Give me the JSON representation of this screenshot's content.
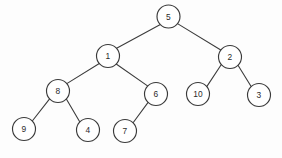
{
  "figure": {
    "type": "binary-tree-diagram",
    "background_color": "#fdfdfd",
    "node_fill_color": "#ffffff",
    "node_stroke_color": "#3a3a3a",
    "edge_color": "#3c3c3c",
    "label_color": "#2b2b2b",
    "node_radius": 11.5
  },
  "nodes": [
    {
      "id": "n5",
      "label": "5",
      "cx": 168.5,
      "cy": 16.5
    },
    {
      "id": "n1",
      "label": "1",
      "cx": 108.0,
      "cy": 56.0
    },
    {
      "id": "n2",
      "label": "2",
      "cx": 230.0,
      "cy": 57.0
    },
    {
      "id": "n8",
      "label": "8",
      "cx": 58.0,
      "cy": 91.0
    },
    {
      "id": "n6",
      "label": "6",
      "cx": 156.0,
      "cy": 94.0
    },
    {
      "id": "n10",
      "label": "10",
      "cx": 198.0,
      "cy": 94.0
    },
    {
      "id": "n3",
      "label": "3",
      "cx": 259.0,
      "cy": 95.0
    },
    {
      "id": "n9",
      "label": "9",
      "cx": 24.0,
      "cy": 129.0
    },
    {
      "id": "n4",
      "label": "4",
      "cx": 88.0,
      "cy": 130.0
    },
    {
      "id": "n7",
      "label": "7",
      "cx": 125.0,
      "cy": 131.0
    }
  ],
  "edges": [
    {
      "id": "e5-1",
      "from": "n5",
      "to": "n1",
      "x1": 159.9,
      "y1": 24.7,
      "x2": 116.6,
      "y2": 48.2
    },
    {
      "id": "e5-2",
      "from": "n5",
      "to": "n2",
      "x1": 177.5,
      "y1": 23.6,
      "x2": 221.2,
      "y2": 50.2
    },
    {
      "id": "e1-8",
      "from": "n1",
      "to": "n8",
      "x1": 99.3,
      "y1": 63.5,
      "x2": 66.8,
      "y2": 83.6
    },
    {
      "id": "e1-6",
      "from": "n1",
      "to": "n6",
      "x1": 116.2,
      "y1": 64.0,
      "x2": 147.9,
      "y2": 86.1
    },
    {
      "id": "e2-10",
      "from": "n2",
      "to": "n10",
      "x1": 221.5,
      "y1": 64.2,
      "x2": 206.6,
      "y2": 86.9
    },
    {
      "id": "e2-3",
      "from": "n2",
      "to": "n3",
      "x1": 238.0,
      "y1": 65.3,
      "x2": 251.3,
      "y2": 86.8
    },
    {
      "id": "e8-9",
      "from": "n8",
      "to": "n9",
      "x1": 49.6,
      "y1": 98.9,
      "x2": 32.3,
      "y2": 121.0
    },
    {
      "id": "e8-4",
      "from": "n8",
      "to": "n4",
      "x1": 66.5,
      "y1": 99.2,
      "x2": 79.7,
      "y2": 121.8
    },
    {
      "id": "e6-7",
      "from": "n6",
      "to": "n7",
      "x1": 148.1,
      "y1": 102.3,
      "x2": 132.9,
      "y2": 123.0
    }
  ],
  "structure": {
    "root": "5",
    "adjacency": [
      {
        "parent": "5",
        "left": "1",
        "right": "2"
      },
      {
        "parent": "1",
        "left": "8",
        "right": "6"
      },
      {
        "parent": "2",
        "left": "10",
        "right": "3"
      },
      {
        "parent": "8",
        "left": "9",
        "right": "4"
      },
      {
        "parent": "6",
        "left": "7",
        "right": null
      }
    ]
  }
}
